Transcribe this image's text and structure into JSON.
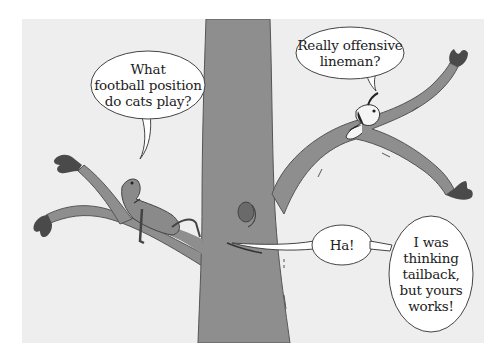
{
  "comic": {
    "panel_background": "#eeeeee",
    "tree_color": "#8e8e8e",
    "outline_color": "#444444",
    "characters": [
      {
        "name": "cat",
        "position": "lying on left branch"
      },
      {
        "name": "dog",
        "position": "lying on upper right branch"
      }
    ],
    "speech_bubbles": [
      {
        "speaker": "cat",
        "text": "What\nfootball position\ndo cats play?"
      },
      {
        "speaker": "dog",
        "text": "Really offensive\nlineman?"
      },
      {
        "speaker": "tree-knot",
        "text": "Ha!"
      },
      {
        "speaker": "tree-knot",
        "text": "I was\nthinking\ntailback,\nbut yours\nworks!"
      }
    ]
  }
}
